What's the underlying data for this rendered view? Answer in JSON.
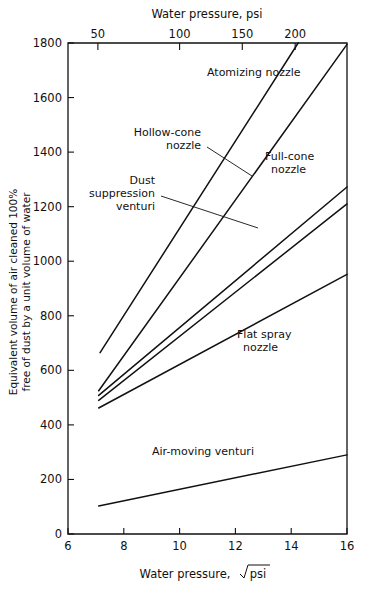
{
  "chart_data": {
    "type": "line",
    "title": "",
    "xlabel": "Water pressure,  √psi",
    "xlabel_prefix": "Water pressure,",
    "xlabel_radicand": "psi",
    "ylabel_line1": "Equivalent volume of air cleaned 100%",
    "ylabel_line2": "free of dust by a unit volume of water",
    "top_axis_label": "Water pressure, psi",
    "xlim": [
      6,
      16
    ],
    "ylim": [
      0,
      1800
    ],
    "xticks": [
      6,
      8,
      10,
      12,
      14,
      16
    ],
    "xticklabels": [
      "6",
      "8",
      "10",
      "12",
      "14",
      "16"
    ],
    "yticks": [
      0,
      200,
      400,
      600,
      800,
      1000,
      1200,
      1400,
      1600,
      1800
    ],
    "yticklabels": [
      "0",
      "200",
      "400",
      "600",
      "800",
      "1000",
      "1200",
      "1400",
      "1600",
      "1800"
    ],
    "top_ticks_psi": [
      50,
      100,
      150,
      200
    ],
    "top_ticklabels": [
      "50",
      "100",
      "150",
      "200"
    ],
    "top_tick_x_sqrtpsi": [
      7.071,
      10.0,
      12.247,
      14.142
    ],
    "grid": false,
    "legend": "inline-annotations",
    "series": [
      {
        "name": "Atomizing nozzle",
        "label": "Atomizing nozzle",
        "label_lines": [
          "Atomizing nozzle"
        ],
        "x": [
          7.15,
          16.0
        ],
        "y": [
          665,
          2335
        ],
        "x_clipped": [
          7.15,
          14.25
        ],
        "y_clipped": [
          665,
          1800
        ]
      },
      {
        "name": "Hollow-cone nozzle",
        "label": "Hollow-cone nozzle",
        "label_lines": [
          "Hollow-cone",
          "nozzle"
        ],
        "x": [
          7.1,
          16.0
        ],
        "y": [
          525,
          1795
        ]
      },
      {
        "name": "Full-cone nozzle",
        "label": "Full-cone nozzle",
        "label_lines": [
          "Full-cone",
          "nozzle"
        ],
        "x": [
          7.1,
          16.0
        ],
        "y": [
          508,
          1272
        ]
      },
      {
        "name": "Dust suppression venturi",
        "label": "Dust suppression venturi",
        "label_lines": [
          "Dust",
          "suppression",
          "venturi"
        ],
        "x": [
          7.1,
          16.0
        ],
        "y": [
          490,
          1210
        ]
      },
      {
        "name": "Flat spray nozzle",
        "label": "Flat spray nozzle",
        "label_lines": [
          "Flat spray",
          "nozzle"
        ],
        "x": [
          7.1,
          16.0
        ],
        "y": [
          462,
          952
        ]
      },
      {
        "name": "Air-moving venturi",
        "label": "Air-moving venturi",
        "label_lines": [
          "Air-moving venturi"
        ],
        "x": [
          7.1,
          16.0
        ],
        "y": [
          103,
          290
        ]
      }
    ]
  },
  "colors": {
    "background": "#ffffff",
    "ink": "#111111",
    "curve": "#111111"
  }
}
